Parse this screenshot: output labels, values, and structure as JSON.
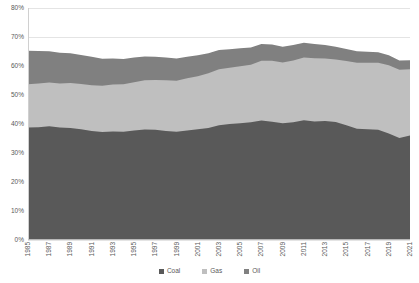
{
  "chart_data": {
    "type": "area",
    "stacked": true,
    "title": "",
    "subtitle": "",
    "xlabel": "",
    "ylabel": "",
    "ylim": [
      0,
      80
    ],
    "yunit": "%",
    "ytick_labels": [
      "0%",
      "10%",
      "20%",
      "30%",
      "40%",
      "50%",
      "60%",
      "70%",
      "80%"
    ],
    "ytick_values": [
      0,
      10,
      20,
      30,
      40,
      50,
      60,
      70,
      80
    ],
    "grid": true,
    "grid_axis": "y",
    "legend_position": "bottom",
    "xlim": [
      1985,
      2021
    ],
    "x": [
      1985,
      1986,
      1987,
      1988,
      1989,
      1990,
      1991,
      1992,
      1993,
      1994,
      1995,
      1996,
      1997,
      1998,
      1999,
      2000,
      2001,
      2002,
      2003,
      2004,
      2005,
      2006,
      2007,
      2008,
      2009,
      2010,
      2011,
      2012,
      2013,
      2014,
      2015,
      2016,
      2017,
      2018,
      2019,
      2020,
      2021
    ],
    "xtick_labels": [
      "1985",
      "1987",
      "1989",
      "1991",
      "1993",
      "1995",
      "1997",
      "1999",
      "2001",
      "2003",
      "2005",
      "2007",
      "2009",
      "2011",
      "2013",
      "2015",
      "2017",
      "2019",
      "2021"
    ],
    "xtick_values": [
      1985,
      1987,
      1989,
      1991,
      1993,
      1995,
      1997,
      1999,
      2001,
      2003,
      2005,
      2007,
      2009,
      2011,
      2013,
      2015,
      2017,
      2019,
      2021
    ],
    "series": [
      {
        "name": "Coal",
        "color": "#595959",
        "values": [
          38.8,
          38.9,
          39.2,
          38.8,
          38.6,
          38.2,
          37.6,
          37.2,
          37.4,
          37.3,
          37.8,
          38.1,
          38.0,
          37.6,
          37.3,
          37.8,
          38.2,
          38.6,
          39.6,
          40.0,
          40.3,
          40.6,
          41.2,
          40.8,
          40.3,
          40.6,
          41.3,
          40.9,
          41.0,
          40.7,
          39.6,
          38.4,
          38.2,
          38.0,
          36.7,
          35.2,
          36.0
        ]
      },
      {
        "name": "Gas",
        "color": "#bfbfbf",
        "values": [
          14.9,
          15.1,
          15.1,
          15.2,
          15.5,
          15.6,
          15.8,
          16.0,
          16.2,
          16.4,
          16.6,
          17.0,
          17.2,
          17.5,
          17.6,
          18.0,
          18.3,
          18.9,
          19.3,
          19.4,
          19.6,
          19.8,
          20.6,
          21.0,
          20.9,
          21.3,
          21.6,
          21.8,
          21.6,
          21.5,
          22.1,
          22.7,
          22.9,
          23.1,
          23.6,
          23.5,
          22.9
        ]
      },
      {
        "name": "Oil",
        "color": "#808080",
        "values": [
          11.6,
          11.2,
          10.8,
          10.6,
          10.3,
          10.0,
          9.8,
          9.3,
          9.0,
          8.7,
          8.5,
          8.2,
          8.0,
          7.8,
          7.7,
          7.4,
          7.2,
          6.9,
          6.6,
          6.4,
          6.2,
          6.0,
          5.8,
          5.6,
          5.4,
          5.3,
          5.1,
          4.9,
          4.6,
          4.4,
          4.2,
          4.0,
          3.8,
          3.6,
          3.4,
          3.2,
          3.1
        ]
      }
    ],
    "legend": [
      {
        "label": "Coal",
        "color": "#595959"
      },
      {
        "label": "Gas",
        "color": "#bfbfbf"
      },
      {
        "label": "Oil",
        "color": "#808080"
      }
    ]
  }
}
